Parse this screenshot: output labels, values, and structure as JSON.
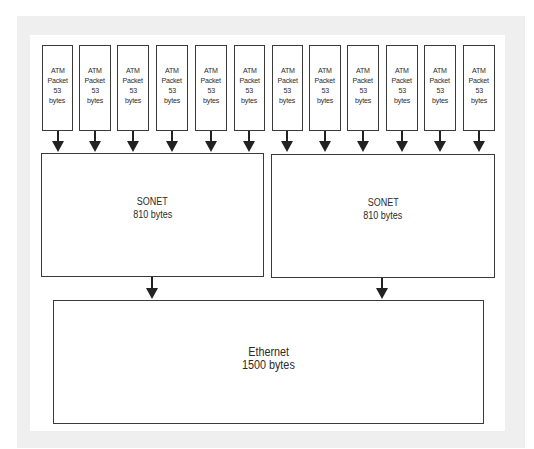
{
  "diagram": {
    "atm_packets": [
      {
        "line1": "ATM",
        "line2": "Packet",
        "line3": "53",
        "line4": "bytes",
        "left": 42,
        "width": 31
      },
      {
        "line1": "ATM",
        "line2": "Packet",
        "line3": "53",
        "line4": "bytes",
        "left": 79,
        "width": 32
      },
      {
        "line1": "ATM",
        "line2": "Packet",
        "line3": "53",
        "line4": "bytes",
        "left": 117,
        "width": 32
      },
      {
        "line1": "ATM",
        "line2": "Packet",
        "line3": "53",
        "line4": "bytes",
        "left": 156,
        "width": 32
      },
      {
        "line1": "ATM",
        "line2": "Packet",
        "line3": "53",
        "line4": "bytes",
        "left": 195,
        "width": 32
      },
      {
        "line1": "ATM",
        "line2": "Packet",
        "line3": "53",
        "line4": "bytes",
        "left": 234,
        "width": 31
      },
      {
        "line1": "ATM",
        "line2": "Packet",
        "line3": "53",
        "line4": "bytes",
        "left": 272,
        "width": 31
      },
      {
        "line1": "ATM",
        "line2": "Packet",
        "line3": "53",
        "line4": "bytes",
        "left": 309,
        "width": 32
      },
      {
        "line1": "ATM",
        "line2": "Packet",
        "line3": "53",
        "line4": "bytes",
        "left": 347,
        "width": 32
      },
      {
        "line1": "ATM",
        "line2": "Packet",
        "line3": "53",
        "line4": "bytes",
        "left": 386,
        "width": 32
      },
      {
        "line1": "ATM",
        "line2": "Packet",
        "line3": "53",
        "line4": "bytes",
        "left": 424,
        "width": 32
      },
      {
        "line1": "ATM",
        "line2": "Packet",
        "line3": "53",
        "line4": "bytes",
        "left": 463,
        "width": 32
      }
    ],
    "sonet_frames": [
      {
        "title": "SONET",
        "size": "810 bytes"
      },
      {
        "title": "SONET",
        "size": "810 bytes"
      }
    ],
    "ethernet_frame": {
      "title": "Ethernet",
      "size": "1500 bytes"
    },
    "colors": {
      "border": "#3a3a3a",
      "arrow": "#222222",
      "frame": "#efefef",
      "background": "#ffffff"
    }
  }
}
